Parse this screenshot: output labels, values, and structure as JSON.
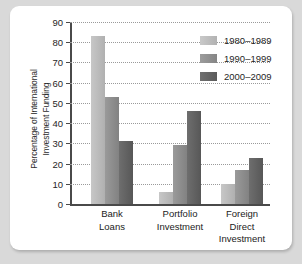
{
  "chart_data": {
    "type": "bar",
    "title": "",
    "xlabel": "",
    "ylabel": "Percentage of International Investment Funding",
    "ylabel_line1": "Percentage of International",
    "ylabel_line2": "Investment Funding",
    "ylim": [
      0,
      90
    ],
    "yticks": [
      0,
      10,
      20,
      30,
      40,
      50,
      60,
      70,
      80,
      90
    ],
    "grid": true,
    "legend_position": "top-right",
    "categories": [
      "Bank Loans",
      "Portfolio Investment",
      "Foreign Direct Investment"
    ],
    "category_labels": [
      "Bank\nLoans",
      "Portfolio\nInvestment",
      "Foreign\nDirect\nInvestment"
    ],
    "series": [
      {
        "name": "1980–1989",
        "color": "#bfbfbf",
        "values": [
          83,
          6,
          10
        ]
      },
      {
        "name": "1990–1999",
        "color": "#919191",
        "values": [
          53,
          29,
          17
        ]
      },
      {
        "name": "2000–2009",
        "color": "#636363",
        "values": [
          31,
          46,
          23
        ]
      }
    ]
  },
  "legend": {
    "items": [
      {
        "label": "1980–1989"
      },
      {
        "label": "1990–1999"
      },
      {
        "label": "2000–2009"
      }
    ]
  },
  "colors": {
    "page_background": "#d9d9d9",
    "card_background": "#ffffff",
    "axis": "#4a4a4a",
    "gridline": "#9a9a9a",
    "text": "#222222"
  }
}
